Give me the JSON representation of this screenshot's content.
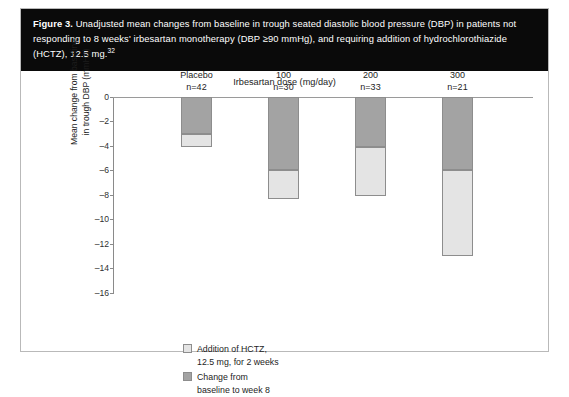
{
  "figure": {
    "caption_label": "Figure 3.",
    "caption_text": " Unadjusted mean changes from baseline in trough seated diastolic blood pressure (DBP) in patients not responding to 8 weeks' irbesartan monotherapy (DBP ≥90 mmHg), and requiring addition of hydrochlorothiazide (HCTZ), 12.5 mg.",
    "caption_ref": "32"
  },
  "chart_data": {
    "type": "bar",
    "title": "Irbesartan dose (mg/day)",
    "xlabel": "Irbesartan dose (mg/day)",
    "ylabel": "Mean change from baseline in trough DBP (mmHg)",
    "ylabel_line1": "Mean change from baseline",
    "ylabel_line2": "in trough DBP (mmHg)",
    "ylim": [
      -16,
      0
    ],
    "yticks": [
      0,
      -2,
      -4,
      -6,
      -8,
      -10,
      -12,
      -14,
      -16
    ],
    "ytick_labels": [
      "0",
      "–2",
      "–4",
      "–6",
      "–8",
      "–10",
      "–12",
      "–14",
      "–16"
    ],
    "grid": false,
    "stacked": true,
    "legend_position": "inside-bottom-left",
    "categories": [
      "Placebo",
      "100",
      "200",
      "300"
    ],
    "category_n": [
      "n=42",
      "n=30",
      "n=33",
      "n=21"
    ],
    "series": [
      {
        "name": "Change from baseline to week 8",
        "color": "#a3a3a3",
        "values": [
          -3.0,
          -6.0,
          -4.1,
          -6.0
        ]
      },
      {
        "name": "Addition of HCTZ, 12.5 mg, for 2 weeks",
        "color": "#e4e4e4",
        "values": [
          -1.1,
          -2.3,
          -4.0,
          -7.0
        ]
      }
    ],
    "totals": [
      -4.1,
      -8.3,
      -8.1,
      -13.0
    ]
  },
  "legend": {
    "items": [
      {
        "swatch": "light",
        "line1": "Addition of HCTZ,",
        "line2": "12.5 mg, for 2 weeks"
      },
      {
        "swatch": "dark",
        "line1": "Change from",
        "line2": "baseline to week 8"
      }
    ]
  }
}
